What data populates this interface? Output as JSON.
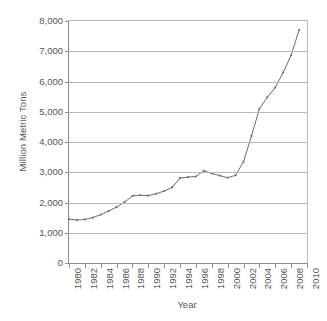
{
  "chart_data": {
    "type": "line",
    "title": "",
    "xlabel": "Year",
    "ylabel": "Million Metric Tons",
    "xlim": [
      1980,
      2010
    ],
    "ylim": [
      0,
      8000
    ],
    "grid": true,
    "legend": "none",
    "line_color": "#6b6b6b",
    "marker": "square",
    "x_tick_labels": [
      "1980",
      "1982",
      "1984",
      "1986",
      "1988",
      "1990",
      "1992",
      "1994",
      "1996",
      "1998",
      "2000",
      "2002",
      "2004",
      "2006",
      "2008",
      "2010"
    ],
    "y_tick_labels": [
      "0",
      "1,000",
      "2,000",
      "3,000",
      "4,000",
      "5,000",
      "6,000",
      "7,000",
      "8,000"
    ],
    "y_tick_values": [
      0,
      1000,
      2000,
      3000,
      4000,
      5000,
      6000,
      7000,
      8000
    ],
    "x": [
      1980,
      1981,
      1982,
      1983,
      1984,
      1985,
      1986,
      1987,
      1988,
      1989,
      1990,
      1991,
      1992,
      1993,
      1994,
      1995,
      1996,
      1997,
      1998,
      1999,
      2000,
      2001,
      2002,
      2003,
      2004,
      2005,
      2006,
      2007,
      2008,
      2009
    ],
    "values": [
      1450,
      1420,
      1440,
      1500,
      1600,
      1720,
      1850,
      2010,
      2220,
      2240,
      2230,
      2290,
      2380,
      2500,
      2810,
      2840,
      2860,
      3050,
      2960,
      2890,
      2820,
      2900,
      3350,
      4200,
      5100,
      5480,
      5800,
      6300,
      6870,
      7700
    ],
    "series_name": "Million Metric Tons"
  }
}
